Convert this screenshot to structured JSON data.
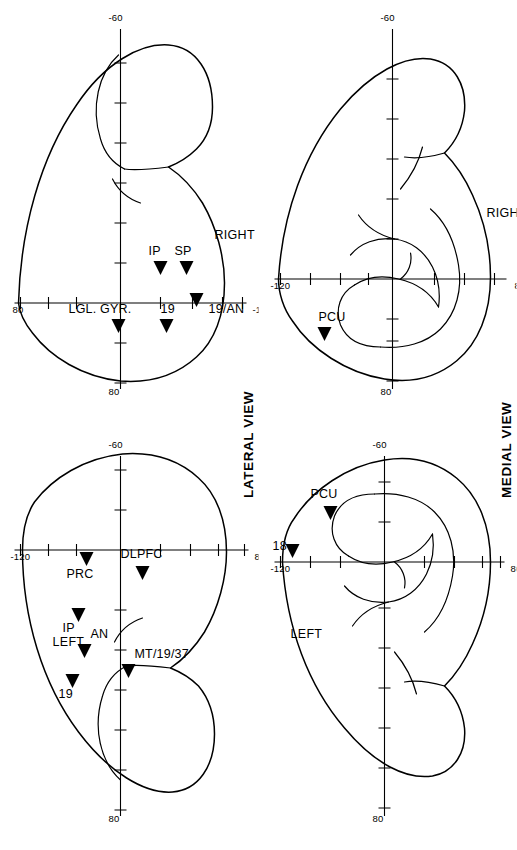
{
  "figure": {
    "rotation_degrees": -90,
    "background_color": "#ffffff",
    "ink_color": "#000000",
    "panel_count": 4
  },
  "titles": {
    "lateral": "LATERAL VIEW",
    "medial": "MEDIAL VIEW"
  },
  "axes": {
    "horizontal_ticks": [
      "80",
      "-60"
    ],
    "vertical_ticks": [
      "80",
      "-120"
    ],
    "x_left": "80",
    "x_right": "-60",
    "y_top": "80",
    "y_bottom": "-120",
    "tick_interval": 20
  },
  "panels": [
    {
      "id": "lateral-right",
      "view": "LATERAL VIEW",
      "hemisphere": "RIGHT",
      "axis": {
        "x_left": "80",
        "x_right": "-60",
        "y_top": "80",
        "y_bottom": "-120"
      },
      "sites": [
        {
          "label": "SP",
          "marker": "triangle"
        },
        {
          "label": "IP",
          "marker": "triangle"
        },
        {
          "label": "19/AN",
          "marker": "triangle"
        },
        {
          "label": "19",
          "marker": "triangle"
        },
        {
          "label": "LGL. GYR.",
          "marker": "triangle"
        }
      ]
    },
    {
      "id": "lateral-left",
      "view": "LATERAL VIEW",
      "hemisphere": "LEFT",
      "axis": {
        "x_left": "80",
        "x_right": "-60",
        "y_top": "80",
        "y_bottom": "-120"
      },
      "sites": [
        {
          "label": "DLPFC",
          "marker": "triangle"
        },
        {
          "label": "PRC",
          "marker": "triangle"
        },
        {
          "label": "IP",
          "marker": "triangle"
        },
        {
          "label": "AN",
          "marker": "triangle"
        },
        {
          "label": "19",
          "marker": "triangle"
        },
        {
          "label": "MT/19/37",
          "marker": "triangle"
        }
      ]
    },
    {
      "id": "medial-right",
      "view": "MEDIAL VIEW",
      "hemisphere": "RIGHT",
      "axis": {
        "x_left": "80",
        "x_right": "-60",
        "y_top": "80",
        "y_bottom": "-120"
      },
      "sites": [
        {
          "label": "PCU",
          "marker": "triangle"
        }
      ]
    },
    {
      "id": "medial-left",
      "view": "MEDIAL VIEW",
      "hemisphere": "LEFT",
      "axis": {
        "x_left": "80",
        "x_right": "-60",
        "y_top": "80",
        "y_bottom": "-120"
      },
      "sites": [
        {
          "label": "PCU",
          "marker": "triangle"
        },
        {
          "label": "18",
          "marker": "triangle"
        }
      ]
    }
  ],
  "labels": {
    "lateral_right": {
      "hemisphere": "RIGHT",
      "sp": "SP",
      "ip": "IP",
      "an19": "19/AN",
      "nineteen": "19",
      "lgl": "LGL. GYR.",
      "x_left": "80",
      "x_right": "-60",
      "y_top": "80",
      "y_bottom": "-120"
    },
    "lateral_left": {
      "hemisphere": "LEFT",
      "dlpfc": "DLPFC",
      "prc": "PRC",
      "ip": "IP",
      "an": "AN",
      "nineteen": "19",
      "mt": "MT/19/37",
      "x_left": "80",
      "x_right": "-60",
      "y_top": "80",
      "y_bottom": "-120"
    },
    "medial_right": {
      "hemisphere": "RIGHT",
      "pcu": "PCU",
      "x_left": "80",
      "x_right": "-60",
      "y_top": "80",
      "y_bottom": "-120"
    },
    "medial_left": {
      "hemisphere": "LEFT",
      "pcu": "PCU",
      "eighteen": "18",
      "x_left": "80",
      "x_right": "-60",
      "y_top": "80",
      "y_bottom": "-120"
    }
  }
}
